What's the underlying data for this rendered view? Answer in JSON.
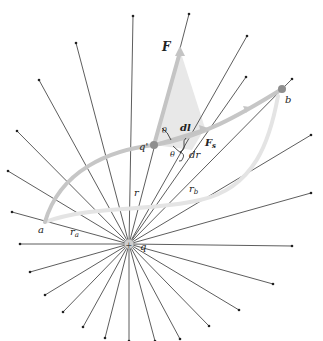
{
  "diagram": {
    "center": {
      "x": 129,
      "y": 244,
      "label": "q"
    },
    "colors": {
      "ray": "#333333",
      "path": "#c4c4c4",
      "path_alt": "#e2e2e2",
      "force_triangle": "#e6e6e6",
      "charge": "#8f8f8f",
      "label": "#222222"
    },
    "rays": [
      [
        133,
        16
      ],
      [
        189,
        14
      ],
      [
        247,
        36
      ],
      [
        76,
        43
      ],
      [
        39,
        80
      ],
      [
        17,
        131
      ],
      [
        8,
        171
      ],
      [
        12,
        212
      ],
      [
        246,
        77
      ],
      [
        292,
        79
      ],
      [
        311,
        135
      ],
      [
        311,
        193
      ],
      [
        20,
        244
      ],
      [
        292,
        246
      ],
      [
        30,
        272
      ],
      [
        45,
        295
      ],
      [
        63,
        312
      ],
      [
        83,
        327
      ],
      [
        105,
        338
      ],
      [
        129,
        341
      ],
      [
        155,
        341
      ],
      [
        180,
        339
      ],
      [
        209,
        326
      ],
      [
        239,
        310
      ],
      [
        273,
        284
      ]
    ],
    "points": {
      "q_prime": {
        "x": 154,
        "y": 145,
        "label": "q'"
      },
      "b": {
        "x": 282,
        "y": 89,
        "label": "b"
      },
      "a": {
        "x": 45,
        "y": 222,
        "label": "a"
      }
    },
    "labels": {
      "F": "F",
      "F_s": "F",
      "F_s_sub": "s",
      "dl": "dl",
      "dr": "dr",
      "theta_top": "θ",
      "theta_bottom": "θ",
      "r": "r",
      "r_a": "r",
      "r_a_sub": "a",
      "r_b": "r",
      "r_b_sub": "b",
      "q_prime": "q'",
      "q": "q",
      "a": "a",
      "b": "b"
    }
  }
}
